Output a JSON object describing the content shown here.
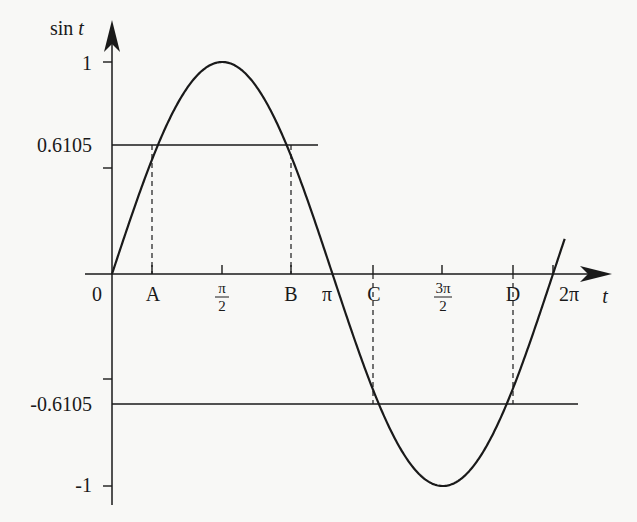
{
  "chart_data": {
    "type": "line",
    "title": "",
    "xlabel": "t",
    "ylabel": "sin t",
    "function": "sin(t)",
    "x_range": [
      0,
      6.2832
    ],
    "ylim": [
      -1,
      1
    ],
    "grid": false,
    "legend": null,
    "y_ticks": [
      {
        "value": 1,
        "label": "1"
      },
      {
        "value": 0.5,
        "label": ""
      },
      {
        "value": 0.6105,
        "label": "0.6105"
      },
      {
        "value": -0.5,
        "label": ""
      },
      {
        "value": -0.6105,
        "label": "-0.6105"
      },
      {
        "value": -1,
        "label": "-1"
      }
    ],
    "x_ticks": [
      {
        "value": 0,
        "label": "0"
      },
      {
        "value": 0.6567,
        "label": "A"
      },
      {
        "value": 1.5708,
        "label": "π/2"
      },
      {
        "value": 2.4849,
        "label": "B"
      },
      {
        "value": 3.1416,
        "label": "π"
      },
      {
        "value": 3.7983,
        "label": "C"
      },
      {
        "value": 4.7124,
        "label": "3π/2"
      },
      {
        "value": 5.6265,
        "label": "D"
      },
      {
        "value": 6.2832,
        "label": "2π"
      }
    ],
    "horizontal_lines": [
      {
        "y": 0.6105,
        "x_from": 0,
        "x_to": 3.2
      },
      {
        "y": -0.6105,
        "x_from": 0,
        "x_to": 6.3
      }
    ],
    "annotations": [
      {
        "point": "A",
        "t": 0.6567,
        "sin": 0.6105,
        "dropline": "dashed"
      },
      {
        "point": "B",
        "t": 2.4849,
        "sin": 0.6105,
        "dropline": "dashed"
      },
      {
        "point": "C",
        "t": 3.7983,
        "sin": -0.6105,
        "dropline": "dashed"
      },
      {
        "point": "D",
        "t": 5.6265,
        "sin": -0.6105,
        "dropline": "dashed"
      }
    ]
  },
  "labels": {
    "y_axis": "sin",
    "y_axis_var": "t",
    "x_axis": "t",
    "y_one": "1",
    "y_pos": "0.6105",
    "y_neg": "-0.6105",
    "y_minus_one": "-1",
    "origin": "0",
    "A": "A",
    "B": "B",
    "C": "C",
    "D": "D",
    "pi": "π",
    "two_pi": "2π",
    "pi_half_num": "π",
    "three_pi_half_num": "3π",
    "den": "2"
  }
}
